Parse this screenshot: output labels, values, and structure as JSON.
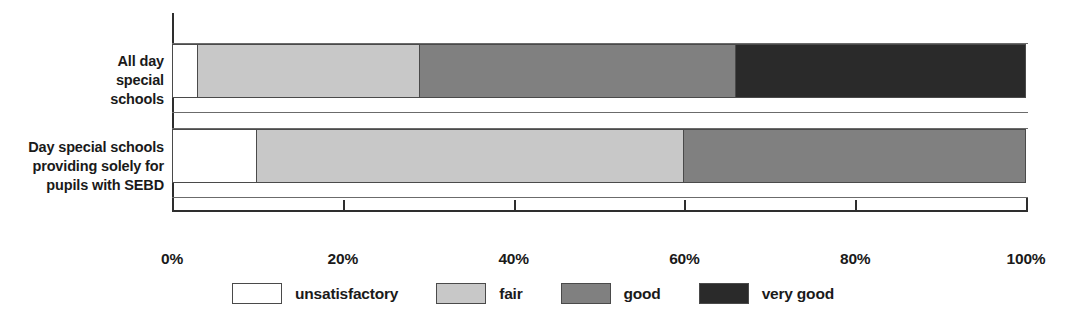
{
  "chart_data": {
    "type": "bar",
    "orientation": "horizontal",
    "stacked": true,
    "normalized_percent": true,
    "title": "",
    "subtitle": "",
    "xlabel": "",
    "ylabel": "",
    "xlim": [
      0,
      100
    ],
    "grid": false,
    "legend_position": "bottom-center",
    "categories": [
      "All day\nspecial\nschools",
      "Day special schools\nproviding solely for\npupils with SEBD"
    ],
    "category_labels": [
      [
        "All day",
        "special",
        "schools"
      ],
      [
        "Day special schools",
        "providing solely for",
        "pupils with SEBD"
      ]
    ],
    "tick_values": [
      0,
      20,
      40,
      60,
      80,
      100
    ],
    "tick_labels": [
      "0%",
      "20%",
      "40%",
      "60%",
      "80%",
      "100%"
    ],
    "series": [
      {
        "name": "unsatisfactory",
        "color": "#ffffff",
        "values": [
          3,
          10
        ]
      },
      {
        "name": "fair",
        "color": "#c8c8c8",
        "values": [
          26,
          50
        ]
      },
      {
        "name": "good",
        "color": "#808080",
        "values": [
          37,
          40
        ]
      },
      {
        "name": "very good",
        "color": "#2a2a2a",
        "values": [
          34,
          0
        ]
      }
    ],
    "legend": [
      {
        "label": "unsatisfactory",
        "color": "#ffffff"
      },
      {
        "label": "fair",
        "color": "#c8c8c8"
      },
      {
        "label": "good",
        "color": "#808080"
      },
      {
        "label": "very good",
        "color": "#2a2a2a"
      }
    ]
  }
}
